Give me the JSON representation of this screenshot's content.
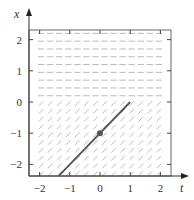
{
  "chart_data": {
    "type": "slope_field",
    "title": "",
    "xlabel": "t",
    "ylabel": "x",
    "xlim": [
      -2.35,
      2.35
    ],
    "ylim": [
      -2.35,
      2.35
    ],
    "x_ticks": [
      -2,
      -1,
      0,
      1,
      2
    ],
    "y_ticks": [
      -2,
      -1,
      0,
      1,
      2
    ],
    "x_tick_labels": [
      "−2",
      "−1",
      "0",
      "1",
      "2"
    ],
    "y_tick_labels": [
      "−2",
      "−1",
      "0",
      "1",
      "2"
    ],
    "grid": false,
    "slope_field": {
      "region_above_x0_slope": 0,
      "region_below_x0_slope": 1,
      "color": "#aaaaaa"
    },
    "solution_curve": {
      "description": "x = t - 1",
      "points": [
        [
          -1.35,
          -2.35
        ],
        [
          1,
          0
        ]
      ],
      "color": "#555555"
    },
    "initial_point": {
      "t": 0,
      "x": -1,
      "color": "#555555"
    }
  },
  "labels": {
    "x_axis": "t",
    "y_axis": "x"
  }
}
